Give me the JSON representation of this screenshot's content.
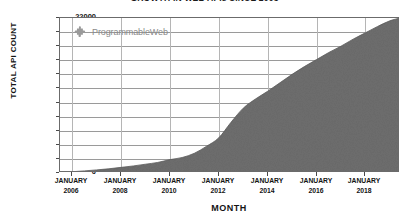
{
  "chart_data": {
    "type": "area",
    "title": "GROWTH IN WEB APIs SINCE 2005",
    "xlabel": "MONTH",
    "ylabel": "TOTAL API COUNT",
    "ylim": [
      0,
      22000
    ],
    "ytick_labels": [
      "22000",
      "20000",
      "18000",
      "16000",
      "14000",
      "12000",
      "10000",
      "8000",
      "6000",
      "4000",
      "2000",
      "0"
    ],
    "ytick_values": [
      22000,
      20000,
      18000,
      16000,
      14000,
      12000,
      10000,
      8000,
      6000,
      4000,
      2000,
      0
    ],
    "xtick_labels": [
      {
        "month": "JANUARY",
        "year": "2006"
      },
      {
        "month": "JANUARY",
        "year": "2008"
      },
      {
        "month": "JANUARY",
        "year": "2010"
      },
      {
        "month": "JANUARY",
        "year": "2012"
      },
      {
        "month": "JANUARY",
        "year": "2014"
      },
      {
        "month": "JANUARY",
        "year": "2016"
      },
      {
        "month": "JANUARY",
        "year": "2018"
      }
    ],
    "xlim": [
      "2005-07",
      "2019-06"
    ],
    "grid": true,
    "legend_position": "none",
    "series": [
      {
        "name": "Total API count",
        "fill_color": "#6e6e6e",
        "x": [
          "2005-07",
          "2006-01",
          "2006-07",
          "2007-01",
          "2007-07",
          "2008-01",
          "2008-07",
          "2009-01",
          "2009-07",
          "2010-01",
          "2010-07",
          "2011-01",
          "2011-07",
          "2012-01",
          "2012-07",
          "2013-01",
          "2013-07",
          "2014-01",
          "2014-07",
          "2015-01",
          "2015-07",
          "2016-01",
          "2016-07",
          "2017-01",
          "2017-07",
          "2018-01",
          "2018-07",
          "2019-01",
          "2019-06"
        ],
        "values": [
          30,
          180,
          300,
          440,
          600,
          800,
          1000,
          1250,
          1500,
          1900,
          2200,
          2800,
          3800,
          5000,
          7200,
          9200,
          10500,
          11600,
          12800,
          14000,
          15100,
          16100,
          17100,
          18000,
          19000,
          19900,
          20800,
          21600,
          22000
        ]
      }
    ],
    "annotations": [
      {
        "type": "watermark",
        "text": "ProgrammableWeb",
        "icon": "puzzle-piece-icon",
        "color": "#8a8a8a",
        "value_at": 20000
      }
    ]
  },
  "watermark": {
    "label": "ProgrammableWeb"
  }
}
